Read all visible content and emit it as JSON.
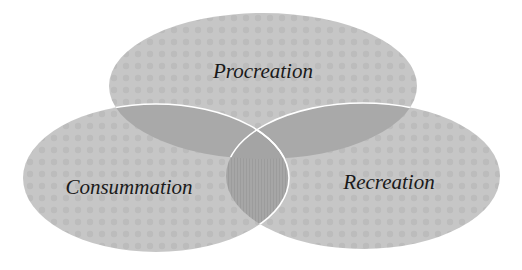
{
  "diagram": {
    "type": "venn",
    "sets": [
      {
        "id": "procreation",
        "label": "Procreation",
        "cx": 263,
        "cy": 86,
        "rx": 154,
        "ry": 73,
        "label_x": 263,
        "label_y": 71
      },
      {
        "id": "consummation",
        "label": "Consummation",
        "cx": 156,
        "cy": 178,
        "rx": 133,
        "ry": 74,
        "label_x": 129,
        "label_y": 187
      },
      {
        "id": "recreation",
        "label": "Recreation",
        "cx": 363,
        "cy": 176,
        "rx": 137,
        "ry": 73,
        "label_x": 389,
        "label_y": 182
      }
    ],
    "colors": {
      "fill": "#c6c6c6",
      "fill_texture": "#b9b9b9",
      "overlap": "#a9a9a9",
      "center": "#a4a4a4",
      "outline": "#ffffff",
      "text": "#1a1a1a"
    }
  }
}
